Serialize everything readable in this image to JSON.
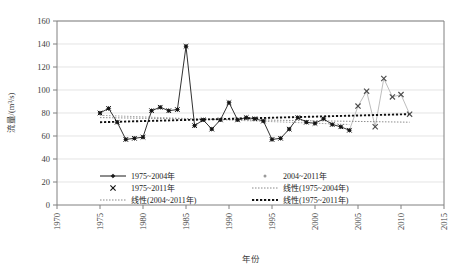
{
  "chart_data": {
    "type": "line",
    "title": "",
    "xlabel": "年份",
    "ylabel": "流量/(m³/s)",
    "xlim": [
      1970,
      2015
    ],
    "ylim": [
      0,
      160
    ],
    "xticks": [
      "1970",
      "1975",
      "1980",
      "1985",
      "1990",
      "1995",
      "2000",
      "2005",
      "2010",
      "2015"
    ],
    "yticks": [
      "0",
      "20",
      "40",
      "60",
      "80",
      "100",
      "120",
      "140",
      "160"
    ],
    "grid": true,
    "legend_position": "below-plot",
    "series": [
      {
        "name": "1975~2004年",
        "marker": "diamond",
        "color": "#1a1a1a",
        "x": [
          1975,
          1976,
          1977,
          1978,
          1979,
          1980,
          1981,
          1982,
          1983,
          1984,
          1985,
          1986,
          1987,
          1988,
          1989,
          1990,
          1991,
          1992,
          1993,
          1994,
          1995,
          1996,
          1997,
          1998,
          1999,
          2000,
          2001,
          2002,
          2003,
          2004
        ],
        "values": [
          80,
          84,
          72,
          57,
          58,
          59,
          82,
          85,
          82,
          83,
          138,
          69,
          74,
          66,
          74,
          89,
          74,
          76,
          75,
          73,
          57,
          58,
          66,
          76,
          72,
          71,
          75,
          70,
          68,
          65
        ]
      },
      {
        "name": "1975~2011年",
        "marker": "cross",
        "color": "#1a1a1a",
        "note": "same points as 1975~2004年 series, rendered with × markers over the full record"
      },
      {
        "name": "2004~2011年",
        "marker": "dot",
        "color": "#b5b5b5",
        "x": [
          2005,
          2006,
          2007,
          2008,
          2009,
          2010,
          2011
        ],
        "values": [
          86,
          99,
          68,
          110,
          94,
          96,
          79
        ]
      }
    ],
    "trendlines": [
      {
        "name": "线性(2004~2011年)",
        "style": "fine-dotted",
        "color": "#808080",
        "x": [
          1975,
          2011
        ],
        "y": [
          76,
          72
        ]
      },
      {
        "name": "线性(1975~2004年)",
        "style": "fine-dotted",
        "color": "#9a9a9a",
        "x": [
          1975,
          2004
        ],
        "y": [
          78,
          70
        ]
      },
      {
        "name": "线性(1975~2011年)",
        "style": "bold-dotted",
        "color": "#111111",
        "x": [
          1975,
          2011
        ],
        "y": [
          72,
          79
        ]
      }
    ]
  },
  "legend": {
    "items": [
      {
        "label": "1975~2004年",
        "marker": "line-diamond"
      },
      {
        "label": "2004~2011年",
        "marker": "dot"
      },
      {
        "label": "1975~2011年",
        "marker": "cross"
      },
      {
        "label": "线性(1975~2004年)",
        "marker": "fine-dotted-line"
      },
      {
        "label": "线性(2004~2011年)",
        "marker": "fine-dotted-line"
      },
      {
        "label": "线性(1975~2011年)",
        "marker": "bold-dotted-line"
      }
    ]
  }
}
